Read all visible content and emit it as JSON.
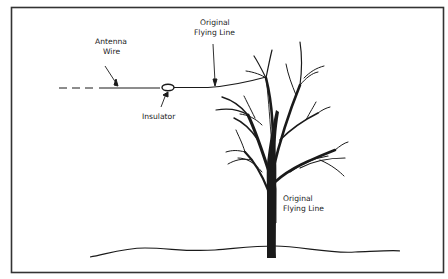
{
  "diagram": {
    "labels": {
      "antenna_wire_line1": "Antenna",
      "antenna_wire_line2": "Wire",
      "insulator": "Insulator",
      "flying_line_top_line1": "Original",
      "flying_line_top_line2": "Flying Line",
      "flying_line_bottom_line1": "Original",
      "flying_line_bottom_line2": "Flying Line"
    },
    "colors": {
      "ink": "#1a1a1a",
      "frame": "#333333",
      "background": "#ffffff"
    }
  }
}
